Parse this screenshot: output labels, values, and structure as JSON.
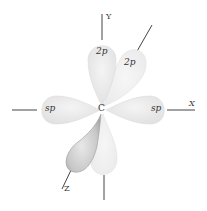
{
  "diagram": {
    "center_label": "C",
    "axes": {
      "x": "X",
      "y": "Y",
      "z": "Z"
    },
    "orbitals": [
      {
        "name": "2p-y-up",
        "label": "2p"
      },
      {
        "name": "2p-z-tilted",
        "label": "2p"
      },
      {
        "name": "sp-left",
        "label": "sp"
      },
      {
        "name": "sp-right",
        "label": "sp"
      },
      {
        "name": "2p-z-front-lower",
        "label": ""
      },
      {
        "name": "2p-y-down",
        "label": ""
      }
    ],
    "colors": {
      "lobe_light": "#e6e6e6",
      "lobe_dark": "#bdbdbd",
      "line": "#444444",
      "text": "#333333"
    }
  }
}
